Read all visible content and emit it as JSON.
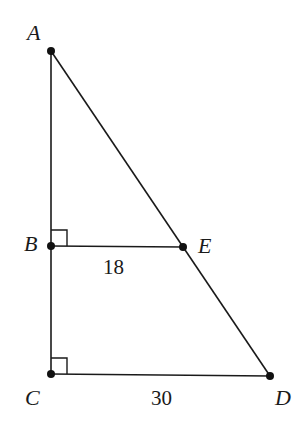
{
  "diagram": {
    "type": "geometry",
    "points": {
      "A": {
        "label": "A",
        "x": 51,
        "y": 51
      },
      "B": {
        "label": "B",
        "x": 51,
        "y": 246
      },
      "C": {
        "label": "C",
        "x": 51,
        "y": 374
      },
      "D": {
        "label": "D",
        "x": 270,
        "y": 376
      },
      "E": {
        "label": "E",
        "x": 183,
        "y": 247
      }
    },
    "segments": [
      {
        "from": "A",
        "to": "C"
      },
      {
        "from": "A",
        "to": "D"
      },
      {
        "from": "B",
        "to": "E"
      },
      {
        "from": "C",
        "to": "D"
      }
    ],
    "right_angles": [
      "B",
      "C"
    ],
    "measurements": {
      "BE": "18",
      "CD": "30"
    },
    "stroke_color": "#1a1a1a"
  }
}
